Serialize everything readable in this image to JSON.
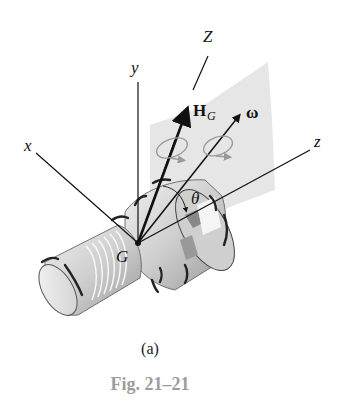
{
  "figure": {
    "labels": {
      "Z": "Z",
      "y": "y",
      "x": "x",
      "z": "z",
      "H": "H",
      "H_sub": "G",
      "omega": "ω",
      "theta": "θ",
      "G": "G"
    },
    "elements": [
      "fixed Z axis",
      "body axes x, y, z through center of mass G",
      "angular momentum vector H_G",
      "angular velocity vector ω",
      "angle θ between Z and z",
      "shaded plane containing Z, z, H_G and ω",
      "axisymmetric spinning body (ribbed cylinder)"
    ],
    "colors": {
      "plane": "#e4e4e4",
      "body": "#d6d6d6",
      "lines": "#111111",
      "caption": "#9c9c9c"
    }
  },
  "captions": {
    "sub": "(a)",
    "figure": "Fig. 21–21"
  }
}
